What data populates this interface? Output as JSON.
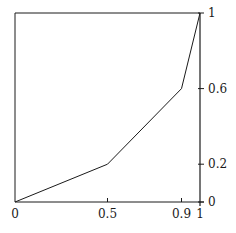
{
  "chart_data": {
    "type": "line",
    "title": "",
    "xlabel": "",
    "ylabel": "",
    "x": [
      0,
      0.5,
      0.9,
      1
    ],
    "series": [
      {
        "name": "curve",
        "values": [
          0,
          0.2,
          0.6,
          1
        ]
      }
    ],
    "xlim": [
      0,
      1
    ],
    "ylim": [
      0,
      1
    ],
    "x_ticks": [
      0,
      0.5,
      0.9,
      1
    ],
    "x_tick_labels": [
      "0",
      "0.5",
      "0.9",
      "1"
    ],
    "y_ticks": [
      0,
      0.2,
      0.6,
      1
    ],
    "y_tick_labels": [
      "0",
      "0.2",
      "0.6",
      "1"
    ],
    "y_axis_position": "right",
    "grid": false,
    "legend": null,
    "colors": {
      "line": "#1a1a1a",
      "axes": "#1a1a1a",
      "background": "#ffffff"
    }
  }
}
